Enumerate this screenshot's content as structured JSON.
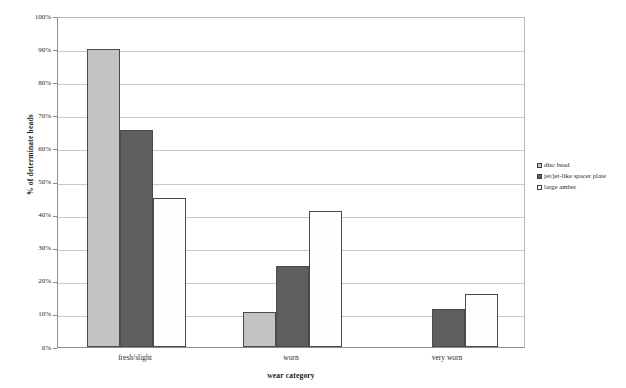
{
  "chart_data": {
    "type": "bar",
    "title": "",
    "xlabel": "wear category",
    "ylabel": "% of determinate beads",
    "categories": [
      "fresh/slight",
      "worn",
      "very worn"
    ],
    "series": [
      {
        "name": "disc bead",
        "color": "#c3c3c3",
        "values": [
          90,
          10.5,
          0
        ]
      },
      {
        "name": "jet/jet-like spacer plate",
        "color": "#5e5e5e",
        "values": [
          65.5,
          24.5,
          11.5
        ]
      },
      {
        "name": "large amber",
        "color": "#ffffff",
        "values": [
          45,
          41,
          16
        ]
      }
    ],
    "ylim": [
      0,
      100
    ],
    "ytick_values": [
      0,
      10,
      20,
      30,
      40,
      50,
      60,
      70,
      80,
      90,
      100
    ],
    "ytick_labels": [
      "0%",
      "10%",
      "20%",
      "30%",
      "40%",
      "50%",
      "60%",
      "70%",
      "80%",
      "90%",
      "100%"
    ],
    "grid": true,
    "legend_position": "right"
  },
  "legend": {
    "items": [
      {
        "label": "disc bead",
        "swatch": "series-0-swatch"
      },
      {
        "label": "jet/jet-like spacer plate",
        "swatch": "series-1-swatch"
      },
      {
        "label": "large amber",
        "swatch": "series-2-swatch"
      }
    ]
  }
}
